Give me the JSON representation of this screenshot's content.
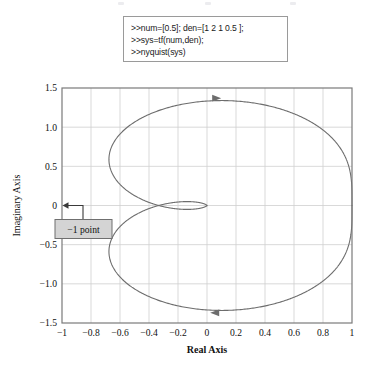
{
  "window": {
    "title": "Nyquist plot figure"
  },
  "command_box": {
    "name": "matlab-command-box",
    "lines": [
      ">>num=[0.5]; den=[1 2 1 0.5 ];",
      ">>sys=tf(num,den);",
      ">>nyquist(sys)"
    ]
  },
  "annotation": {
    "label": "−1 point",
    "target_x": -1,
    "target_y": 0
  },
  "colors": {
    "curve": "#6d6d6d",
    "grid": "#cfcfcf",
    "frame": "#7a7a7a",
    "callout_fill": "#d4d4d4",
    "callout_border": "#6f6f6f",
    "text": "#111111",
    "box_border": "#9a9a9a"
  },
  "chart_data": {
    "type": "line",
    "title": "",
    "xlabel": "Real Axis",
    "ylabel": "Imaginary Axis",
    "xlim": [
      -1,
      1
    ],
    "ylim": [
      -1.5,
      1.5
    ],
    "xticks": [
      -1,
      -0.8,
      -0.6,
      -0.4,
      -0.2,
      0,
      0.2,
      0.4,
      0.6,
      0.8,
      1
    ],
    "xticklabels": [
      "−1",
      "−0.8",
      "−0.6",
      "−0.4",
      "−0.2",
      "0",
      "0.2",
      "0.4",
      "0.6",
      "0.8",
      "1"
    ],
    "yticks": [
      -1.5,
      -1.0,
      -0.5,
      0,
      0.5,
      1.0,
      1.5
    ],
    "yticklabels": [
      "−1.5",
      "−1.0",
      "−0.5",
      "0",
      "0.5",
      "1.0",
      "1.5"
    ],
    "grid": true,
    "legend": false,
    "transfer_function": {
      "numerator": [
        0.5
      ],
      "denominator": [
        1,
        2,
        1,
        0.5
      ]
    },
    "series": [
      {
        "name": "Nyquist contour (positive frequency)",
        "direction_arrow": "right",
        "arrow_at": {
          "x": 0.06,
          "y": 1.37
        }
      },
      {
        "name": "Nyquist contour (negative frequency)",
        "direction_arrow": "left",
        "arrow_at": {
          "x": 0.06,
          "y": -1.37
        }
      }
    ],
    "notes": [
      "DC gain G(0) = 1.0 at real axis",
      "Large outer loop extends to Im ≈ ±1.4 and Re ≈ 1",
      "Small flat inner loop between Re ≈ −0.63 and Re ≈ 0 near Im = 0",
      "Leftmost real-axis crossing of inner loop ≈ −0.63"
    ]
  }
}
